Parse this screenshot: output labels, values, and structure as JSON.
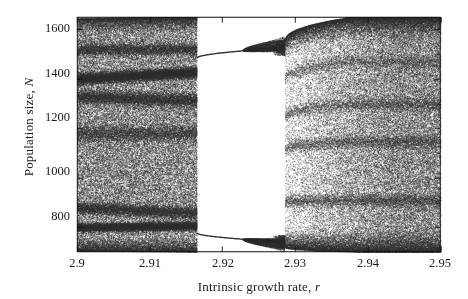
{
  "figure": {
    "xlabel_text": "Intrinsic growth rate, ",
    "xlabel_symbol": "r",
    "ylabel_text": "Population size, ",
    "ylabel_symbol": "N"
  },
  "chart_data": {
    "type": "scatter",
    "title": "",
    "xlabel": "Intrinsic growth rate, r",
    "ylabel": "Population size, N",
    "xlim": [
      2.9,
      2.95
    ],
    "ylim": [
      700,
      1650
    ],
    "xticks": [
      2.9,
      2.91,
      2.92,
      2.93,
      2.94,
      2.95
    ],
    "xticklabels": [
      "2.9",
      "2.91",
      "2.92",
      "2.93",
      "2.94",
      "2.95"
    ],
    "yticks": [
      800,
      1000,
      1200,
      1400,
      1600
    ],
    "yticklabels": [
      "800",
      "1000",
      "1200",
      "1400",
      "1600"
    ],
    "grid": false,
    "legend": null,
    "regions": [
      {
        "name": "left-chaotic-band",
        "r_range": [
          2.9,
          2.9165
        ],
        "n_range": [
          700,
          1650
        ],
        "character": "fully developed chaos filling the vertical extent with denser filaments near N=1400 and N=800"
      },
      {
        "name": "period-2-window",
        "r_range": [
          2.9165,
          2.9285
        ],
        "branches": [
          {
            "name": "upper-branch",
            "n_start": 1487,
            "n_end": 1525
          },
          {
            "name": "lower-branch",
            "n_start": 775,
            "n_end": 745
          }
        ],
        "character": "clean period-2 window with two smooth branches; each branch undergoes a period-doubling cascade near r=2.9225 and r=2.9285"
      },
      {
        "name": "right-chaotic-band",
        "r_range": [
          2.9295,
          2.95
        ],
        "n_range": [
          700,
          1650
        ],
        "character": "chaos re-emerging from the cascade, widening toward r=2.95 until it spans the full plotted range"
      }
    ],
    "bifurcation_points": [
      {
        "r": 2.9165,
        "event": "interior crisis / start of period-2 window"
      },
      {
        "r": 2.9228,
        "event": "period-2 to period-4 doubling (upper and lower branch split)"
      },
      {
        "r": 2.9285,
        "event": "accumulation of cascade, return to chaos"
      }
    ],
    "axis_style": {
      "frame": "full box",
      "ticks_inward": true,
      "minor_ticks_right_axis": true,
      "point_color": "#303030",
      "point_size_px": 0.85
    }
  }
}
